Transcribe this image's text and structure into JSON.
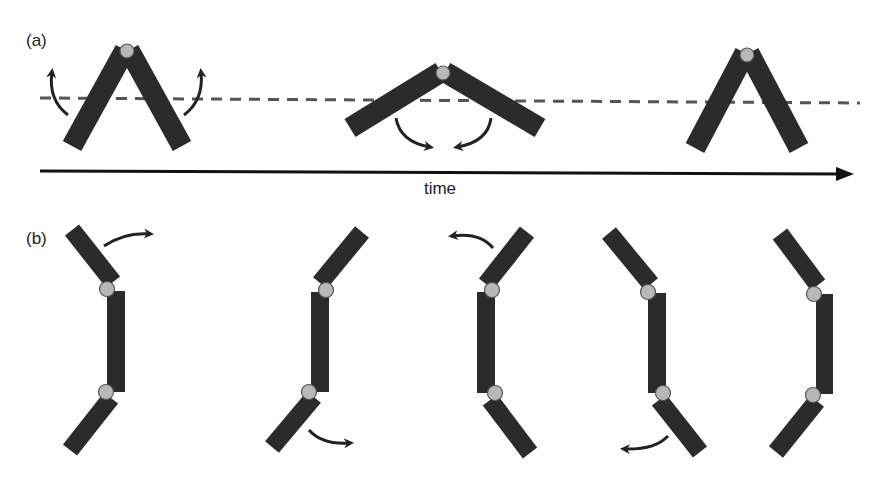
{
  "panels": {
    "a": {
      "label": "(a)",
      "axis_label": "time",
      "description": "Two-segment linkage flapping; dashed reference line; time arrow",
      "poses": [
        {
          "hinge": [
            127,
            51
          ],
          "left_end": [
            72,
            146
          ],
          "right_end": [
            182,
            146
          ],
          "arrows": "outward-up"
        },
        {
          "hinge": [
            443,
            73
          ],
          "left_end": [
            352,
            128
          ],
          "right_end": [
            538,
            128
          ],
          "arrows": "inward-down"
        },
        {
          "hinge": [
            747,
            55
          ],
          "left_end": [
            695,
            148
          ],
          "right_end": [
            799,
            148
          ],
          "arrows": "none"
        }
      ]
    },
    "b": {
      "label": "(b)",
      "description": "Three-segment chain sequence of configurations",
      "poses": [
        {
          "top_end": [
            72,
            230
          ],
          "top_hinge": [
            107,
            289
          ],
          "bottom_hinge": [
            106,
            392
          ],
          "bottom_end": [
            70,
            450
          ],
          "arrow": "top-right"
        },
        {
          "top_end": [
            362,
            232
          ],
          "top_hinge": [
            326,
            290
          ],
          "bottom_hinge": [
            309,
            392
          ],
          "bottom_end": [
            272,
            447
          ],
          "arrow": "bottom-right"
        },
        {
          "top_end": [
            527,
            232
          ],
          "top_hinge": [
            492,
            290
          ],
          "bottom_hinge": [
            495,
            393
          ],
          "bottom_end": [
            530,
            453
          ],
          "arrow": "top-left"
        },
        {
          "top_end": [
            609,
            233
          ],
          "top_hinge": [
            648,
            292
          ],
          "bottom_hinge": [
            663,
            393
          ],
          "bottom_end": [
            700,
            452
          ],
          "arrow": "bottom-left"
        },
        {
          "top_end": [
            780,
            234
          ],
          "top_hinge": [
            814,
            294
          ],
          "bottom_hinge": [
            813,
            395
          ],
          "bottom_end": [
            776,
            452
          ],
          "arrow": "none"
        }
      ]
    }
  },
  "colors": {
    "bar": "#2b2b2b",
    "joint_fill": "#b8b8b8",
    "joint_stroke": "#555555",
    "dashed_line": "#555555",
    "arrow": "#222222",
    "text": "#222222"
  }
}
